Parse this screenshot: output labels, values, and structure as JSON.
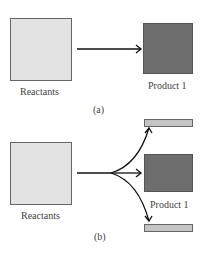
{
  "panel_a": {
    "reactants_label": "Reactants",
    "product_label": "Product 1",
    "caption": "(a)"
  },
  "panel_b": {
    "reactants_label": "Reactants",
    "product_label": "Product 1",
    "caption": "(b)"
  },
  "colors": {
    "reactants_fill": "#e3e3e3",
    "product_fill": "#6e6e6e",
    "side_product_fill": "#c4c4c4",
    "arrow": "#111111"
  }
}
